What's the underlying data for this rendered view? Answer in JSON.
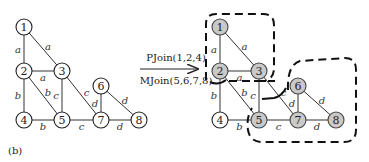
{
  "caption": "(b)",
  "operations": {
    "top": "PJoin(1,2,4)",
    "bottom": "MJoin(5,6,7,8)"
  },
  "colors": {
    "shaded_node": "#c9c9c9",
    "plain_node": "#ffffff",
    "stroke": "#222222"
  },
  "left_graph": {
    "nodes": [
      {
        "id": "1",
        "x": 24,
        "y": 27,
        "shaded": false
      },
      {
        "id": "2",
        "x": 24,
        "y": 71,
        "shaded": false
      },
      {
        "id": "3",
        "x": 62,
        "y": 71,
        "shaded": false
      },
      {
        "id": "4",
        "x": 24,
        "y": 120,
        "shaded": false
      },
      {
        "id": "5",
        "x": 62,
        "y": 120,
        "shaded": false
      },
      {
        "id": "6",
        "x": 101,
        "y": 86,
        "shaded": false
      },
      {
        "id": "7",
        "x": 101,
        "y": 120,
        "shaded": false
      },
      {
        "id": "8",
        "x": 139,
        "y": 120,
        "shaded": false
      }
    ]
  },
  "right_graph": {
    "nodes": [
      {
        "id": "1",
        "x": 220,
        "y": 27,
        "shaded": true
      },
      {
        "id": "2",
        "x": 220,
        "y": 71,
        "shaded": true
      },
      {
        "id": "3",
        "x": 259,
        "y": 71,
        "shaded": true
      },
      {
        "id": "4",
        "x": 220,
        "y": 120,
        "shaded": false
      },
      {
        "id": "5",
        "x": 259,
        "y": 120,
        "shaded": true
      },
      {
        "id": "6",
        "x": 298,
        "y": 86,
        "shaded": true
      },
      {
        "id": "7",
        "x": 298,
        "y": 120,
        "shaded": true
      },
      {
        "id": "8",
        "x": 336,
        "y": 120,
        "shaded": true
      }
    ]
  },
  "edges": [
    {
      "from": "1",
      "to": "2",
      "label": "a"
    },
    {
      "from": "1",
      "to": "3",
      "label": "a"
    },
    {
      "from": "2",
      "to": "3",
      "label": "a"
    },
    {
      "from": "2",
      "to": "4",
      "label": "b"
    },
    {
      "from": "2",
      "to": "5",
      "label": "b"
    },
    {
      "from": "4",
      "to": "5",
      "label": "b"
    },
    {
      "from": "3",
      "to": "5",
      "label": "c"
    },
    {
      "from": "3",
      "to": "7",
      "label": "c"
    },
    {
      "from": "5",
      "to": "7",
      "label": "c"
    },
    {
      "from": "6",
      "to": "7",
      "label": "d"
    },
    {
      "from": "6",
      "to": "8",
      "label": "d"
    },
    {
      "from": "7",
      "to": "8",
      "label": "d"
    }
  ],
  "partitions": [
    {
      "name": "PJoin group",
      "members": [
        "1",
        "2",
        "3"
      ]
    },
    {
      "name": "MJoin group",
      "members": [
        "5",
        "6",
        "7",
        "8"
      ]
    }
  ]
}
